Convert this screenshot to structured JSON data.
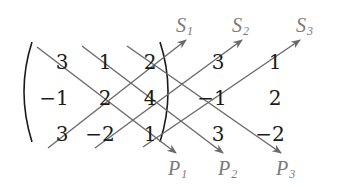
{
  "diagram": {
    "matrix": [
      [
        "3",
        "1",
        "2"
      ],
      [
        "−1",
        "2",
        "4"
      ],
      [
        "3",
        "−2",
        "1"
      ]
    ],
    "extension_columns": [
      [
        "3",
        "1"
      ],
      [
        "−1",
        "2"
      ],
      [
        "3",
        "−2"
      ]
    ],
    "s_labels": [
      {
        "letter": "S",
        "sub": "1"
      },
      {
        "letter": "S",
        "sub": "2"
      },
      {
        "letter": "S",
        "sub": "3"
      }
    ],
    "p_labels": [
      {
        "letter": "P",
        "sub": "1"
      },
      {
        "letter": "P",
        "sub": "2"
      },
      {
        "letter": "P",
        "sub": "3"
      }
    ],
    "colors": {
      "numbers": "#1a1a1a",
      "lines": "#6a6a6a",
      "labels": "#7a7a7a"
    }
  }
}
